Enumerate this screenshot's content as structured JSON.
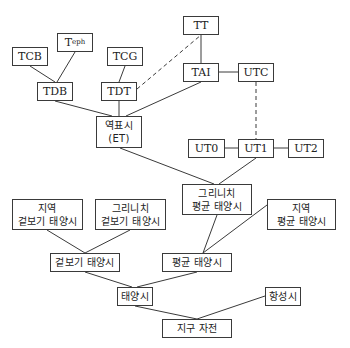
{
  "diagram": {
    "nodes": [
      {
        "id": "TCB",
        "label": "TCB",
        "x": 12,
        "y": 47,
        "w": 36,
        "h": 19,
        "lang": "en"
      },
      {
        "id": "Teph",
        "label": "T",
        "sub": "eph",
        "x": 57,
        "y": 33,
        "w": 36,
        "h": 19,
        "lang": "en"
      },
      {
        "id": "TCG",
        "label": "TCG",
        "x": 107,
        "y": 47,
        "w": 36,
        "h": 19,
        "lang": "en"
      },
      {
        "id": "TT",
        "label": "TT",
        "x": 183,
        "y": 16,
        "w": 36,
        "h": 19,
        "lang": "en"
      },
      {
        "id": "TDB",
        "label": "TDB",
        "x": 37,
        "y": 82,
        "w": 36,
        "h": 19,
        "lang": "en"
      },
      {
        "id": "TDT",
        "label": "TDT",
        "x": 101,
        "y": 82,
        "w": 36,
        "h": 19,
        "lang": "en"
      },
      {
        "id": "TAI",
        "label": "TAI",
        "x": 183,
        "y": 63,
        "w": 36,
        "h": 19,
        "lang": "en"
      },
      {
        "id": "UTC",
        "label": "UTC",
        "x": 238,
        "y": 63,
        "w": 36,
        "h": 19,
        "lang": "en"
      },
      {
        "id": "ET",
        "label": "역표시\n(ET)",
        "x": 96,
        "y": 116,
        "w": 46,
        "h": 32,
        "lang": "ko"
      },
      {
        "id": "UT0",
        "label": "UT0",
        "x": 188,
        "y": 139,
        "w": 37,
        "h": 19,
        "lang": "en"
      },
      {
        "id": "UT1",
        "label": "UT1",
        "x": 238,
        "y": 139,
        "w": 36,
        "h": 19,
        "lang": "en"
      },
      {
        "id": "UT2",
        "label": "UT2",
        "x": 288,
        "y": 139,
        "w": 36,
        "h": 19,
        "lang": "en"
      },
      {
        "id": "GMST",
        "label": "그리니치\n평균 태양시",
        "x": 182,
        "y": 184,
        "w": 70,
        "h": 31,
        "lang": "ko"
      },
      {
        "id": "LAST",
        "label": "지역\n겉보기 태양시",
        "x": 12,
        "y": 199,
        "w": 71,
        "h": 31,
        "lang": "ko"
      },
      {
        "id": "GAST",
        "label": "그리니치\n겉보기 태양시",
        "x": 95,
        "y": 199,
        "w": 71,
        "h": 31,
        "lang": "ko"
      },
      {
        "id": "LMST",
        "label": "지역\n평균 태양시",
        "x": 267,
        "y": 199,
        "w": 69,
        "h": 31,
        "lang": "ko"
      },
      {
        "id": "AST",
        "label": "겉보기 태양시",
        "x": 50,
        "y": 253,
        "w": 70,
        "h": 19,
        "lang": "ko"
      },
      {
        "id": "MST",
        "label": "평균 태양시",
        "x": 162,
        "y": 253,
        "w": 70,
        "h": 19,
        "lang": "ko"
      },
      {
        "id": "ST",
        "label": "태양시",
        "x": 117,
        "y": 287,
        "w": 36,
        "h": 19,
        "lang": "ko"
      },
      {
        "id": "SID",
        "label": "항성시",
        "x": 265,
        "y": 287,
        "w": 36,
        "h": 19,
        "lang": "ko"
      },
      {
        "id": "ER",
        "label": "지구 자전",
        "x": 162,
        "y": 319,
        "w": 70,
        "h": 19,
        "lang": "ko"
      }
    ],
    "edges": [
      {
        "from": "TCB",
        "to": "TDB",
        "x1": 30,
        "y1": 66,
        "x2": 55,
        "y2": 82,
        "style": "solid"
      },
      {
        "from": "Teph",
        "to": "TDB",
        "x1": 75,
        "y1": 52,
        "x2": 57,
        "y2": 82,
        "style": "solid"
      },
      {
        "from": "TCG",
        "to": "TDT",
        "x1": 125,
        "y1": 66,
        "x2": 119,
        "y2": 82,
        "style": "solid"
      },
      {
        "from": "TDT",
        "to": "TT",
        "x1": 137,
        "y1": 89,
        "x2": 201,
        "y2": 35,
        "style": "dashed"
      },
      {
        "from": "TT",
        "to": "TAI",
        "x1": 201,
        "y1": 35,
        "x2": 201,
        "y2": 63,
        "style": "solid"
      },
      {
        "from": "TAI",
        "to": "UTC",
        "x1": 219,
        "y1": 72,
        "x2": 238,
        "y2": 72,
        "style": "solid"
      },
      {
        "from": "TDB",
        "to": "ET",
        "x1": 55,
        "y1": 101,
        "x2": 112,
        "y2": 116,
        "style": "solid"
      },
      {
        "from": "TDT",
        "to": "ET",
        "x1": 119,
        "y1": 101,
        "x2": 119,
        "y2": 116,
        "style": "solid"
      },
      {
        "from": "TAI",
        "to": "ET",
        "x1": 201,
        "y1": 82,
        "x2": 126,
        "y2": 116,
        "style": "solid"
      },
      {
        "from": "UTC",
        "to": "UT1",
        "x1": 256,
        "y1": 82,
        "x2": 256,
        "y2": 139,
        "style": "dashed"
      },
      {
        "from": "UT0",
        "to": "UT1",
        "x1": 225,
        "y1": 148,
        "x2": 238,
        "y2": 148,
        "style": "solid"
      },
      {
        "from": "UT1",
        "to": "UT2",
        "x1": 274,
        "y1": 148,
        "x2": 288,
        "y2": 148,
        "style": "solid"
      },
      {
        "from": "ET",
        "to": "GMST",
        "x1": 120,
        "y1": 148,
        "x2": 214,
        "y2": 184,
        "style": "solid"
      },
      {
        "from": "UT1",
        "to": "GMST",
        "x1": 256,
        "y1": 158,
        "x2": 219,
        "y2": 184,
        "style": "solid"
      },
      {
        "from": "LAST",
        "to": "AST",
        "x1": 47,
        "y1": 230,
        "x2": 85,
        "y2": 253,
        "style": "solid"
      },
      {
        "from": "GAST",
        "to": "AST",
        "x1": 130,
        "y1": 230,
        "x2": 85,
        "y2": 253,
        "style": "solid"
      },
      {
        "from": "GMST",
        "to": "MST",
        "x1": 217,
        "y1": 215,
        "x2": 203,
        "y2": 253,
        "style": "solid"
      },
      {
        "from": "LMST",
        "to": "MST",
        "x1": 267,
        "y1": 205,
        "x2": 203,
        "y2": 253,
        "style": "solid"
      },
      {
        "from": "AST",
        "to": "ST",
        "x1": 85,
        "y1": 272,
        "x2": 132,
        "y2": 287,
        "style": "solid"
      },
      {
        "from": "MST",
        "to": "ST",
        "x1": 197,
        "y1": 272,
        "x2": 137,
        "y2": 287,
        "style": "solid"
      },
      {
        "from": "ST",
        "to": "ER",
        "x1": 135,
        "y1": 306,
        "x2": 197,
        "y2": 319,
        "style": "solid"
      },
      {
        "from": "SID",
        "to": "ER",
        "x1": 265,
        "y1": 296,
        "x2": 197,
        "y2": 319,
        "style": "solid"
      }
    ]
  }
}
